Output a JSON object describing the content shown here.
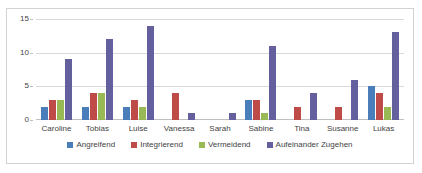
{
  "chart_data": {
    "type": "bar",
    "title": "",
    "subtitle": "",
    "xlabel": "",
    "ylabel": "",
    "ylim": [
      0,
      15
    ],
    "yticks": [
      0,
      5,
      10,
      15
    ],
    "grid": true,
    "legend_position": "bottom",
    "categories": [
      "Caroline",
      "Tobias",
      "Luise",
      "Vanessa",
      "Sarah",
      "Sabine",
      "Tina",
      "Susanne",
      "Lukas"
    ],
    "series": [
      {
        "name": "Angreifend",
        "color": "#4a7ebb",
        "values": [
          2,
          2,
          2,
          0,
          0,
          3,
          0,
          0,
          5
        ]
      },
      {
        "name": "Integrierend",
        "color": "#be4b48",
        "values": [
          3,
          4,
          3,
          4,
          0,
          3,
          2,
          2,
          4
        ]
      },
      {
        "name": "Vermeidend",
        "color": "#98b954",
        "values": [
          3,
          4,
          2,
          0,
          0,
          1,
          0,
          0,
          2
        ]
      },
      {
        "name": "Aufeinander Zugehen",
        "color": "#645f9d",
        "values": [
          9,
          12,
          14,
          1,
          1,
          11,
          4,
          6,
          13
        ]
      }
    ]
  }
}
